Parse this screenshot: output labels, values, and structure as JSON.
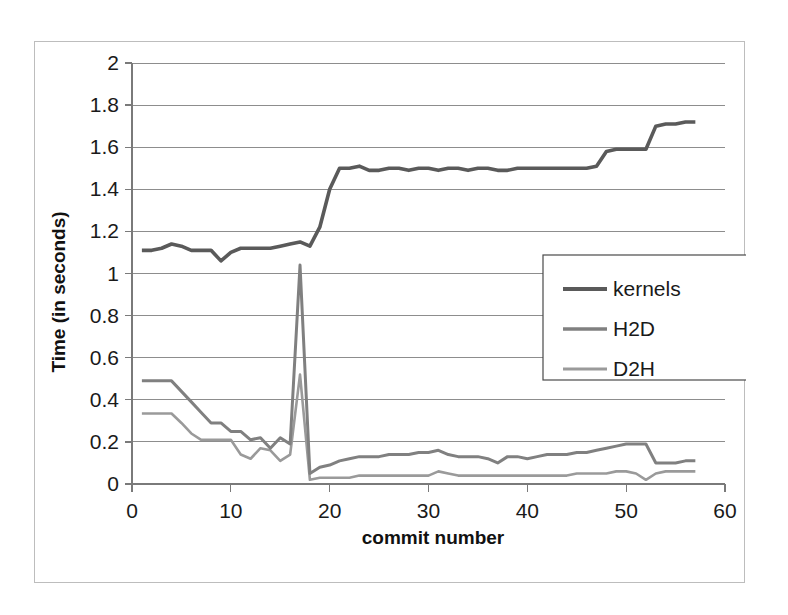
{
  "chart_data": {
    "type": "line",
    "title": "",
    "xlabel": "commit number",
    "ylabel": "Time (in seconds)",
    "xlim": [
      0,
      60
    ],
    "ylim": [
      0,
      2
    ],
    "xticks": [
      0,
      10,
      20,
      30,
      40,
      50,
      60
    ],
    "xtick_labels": [
      "0",
      "10",
      "20",
      "30",
      "40",
      "50",
      "60"
    ],
    "yticks": [
      0,
      0.2,
      0.4,
      0.6,
      0.8,
      1,
      1.2,
      1.4,
      1.6,
      1.8,
      2
    ],
    "ytick_labels": [
      "0",
      "0.2",
      "0.4",
      "0.6",
      "0.8",
      "1",
      "1.2",
      "1.4",
      "1.6",
      "1.8",
      "2"
    ],
    "grid": "horizontal",
    "legend_position": "center-right",
    "x": [
      1,
      2,
      3,
      4,
      5,
      6,
      7,
      8,
      9,
      10,
      11,
      12,
      13,
      14,
      15,
      16,
      17,
      18,
      19,
      20,
      21,
      22,
      23,
      24,
      25,
      26,
      27,
      28,
      29,
      30,
      31,
      32,
      33,
      34,
      35,
      36,
      37,
      38,
      39,
      40,
      41,
      42,
      43,
      44,
      45,
      46,
      47,
      48,
      49,
      50,
      51,
      52,
      53,
      54,
      55,
      56,
      57
    ],
    "series": [
      {
        "name": "kernels",
        "color": "#5a5a5a",
        "values": [
          1.11,
          1.11,
          1.12,
          1.14,
          1.13,
          1.11,
          1.11,
          1.11,
          1.06,
          1.1,
          1.12,
          1.12,
          1.12,
          1.12,
          1.13,
          1.14,
          1.15,
          1.13,
          1.22,
          1.4,
          1.5,
          1.5,
          1.51,
          1.49,
          1.49,
          1.5,
          1.5,
          1.49,
          1.5,
          1.5,
          1.49,
          1.5,
          1.5,
          1.49,
          1.5,
          1.5,
          1.49,
          1.49,
          1.5,
          1.5,
          1.5,
          1.5,
          1.5,
          1.5,
          1.5,
          1.5,
          1.51,
          1.58,
          1.59,
          1.59,
          1.59,
          1.59,
          1.7,
          1.71,
          1.71,
          1.72,
          1.72
        ]
      },
      {
        "name": "H2D",
        "color": "#808080",
        "values": [
          0.49,
          0.49,
          0.49,
          0.49,
          0.44,
          0.39,
          0.34,
          0.29,
          0.29,
          0.25,
          0.25,
          0.21,
          0.22,
          0.17,
          0.22,
          0.19,
          1.04,
          0.05,
          0.08,
          0.09,
          0.11,
          0.12,
          0.13,
          0.13,
          0.13,
          0.14,
          0.14,
          0.14,
          0.15,
          0.15,
          0.16,
          0.14,
          0.13,
          0.13,
          0.13,
          0.12,
          0.1,
          0.13,
          0.13,
          0.12,
          0.13,
          0.14,
          0.14,
          0.14,
          0.15,
          0.15,
          0.16,
          0.17,
          0.18,
          0.19,
          0.19,
          0.19,
          0.1,
          0.1,
          0.1,
          0.11,
          0.11
        ]
      },
      {
        "name": "D2H",
        "color": "#9a9a9a",
        "values": [
          0.335,
          0.335,
          0.335,
          0.335,
          0.29,
          0.24,
          0.21,
          0.21,
          0.21,
          0.21,
          0.14,
          0.12,
          0.17,
          0.16,
          0.11,
          0.14,
          0.52,
          0.02,
          0.03,
          0.03,
          0.03,
          0.03,
          0.04,
          0.04,
          0.04,
          0.04,
          0.04,
          0.04,
          0.04,
          0.04,
          0.06,
          0.05,
          0.04,
          0.04,
          0.04,
          0.04,
          0.04,
          0.04,
          0.04,
          0.04,
          0.04,
          0.04,
          0.04,
          0.04,
          0.05,
          0.05,
          0.05,
          0.05,
          0.06,
          0.06,
          0.05,
          0.02,
          0.05,
          0.06,
          0.06,
          0.06,
          0.06
        ]
      }
    ]
  },
  "legend": {
    "entries": [
      {
        "label": "kernels"
      },
      {
        "label": "H2D"
      },
      {
        "label": "D2H"
      }
    ]
  },
  "axes": {
    "x_title": "commit number",
    "y_title": "Time (in seconds)"
  }
}
